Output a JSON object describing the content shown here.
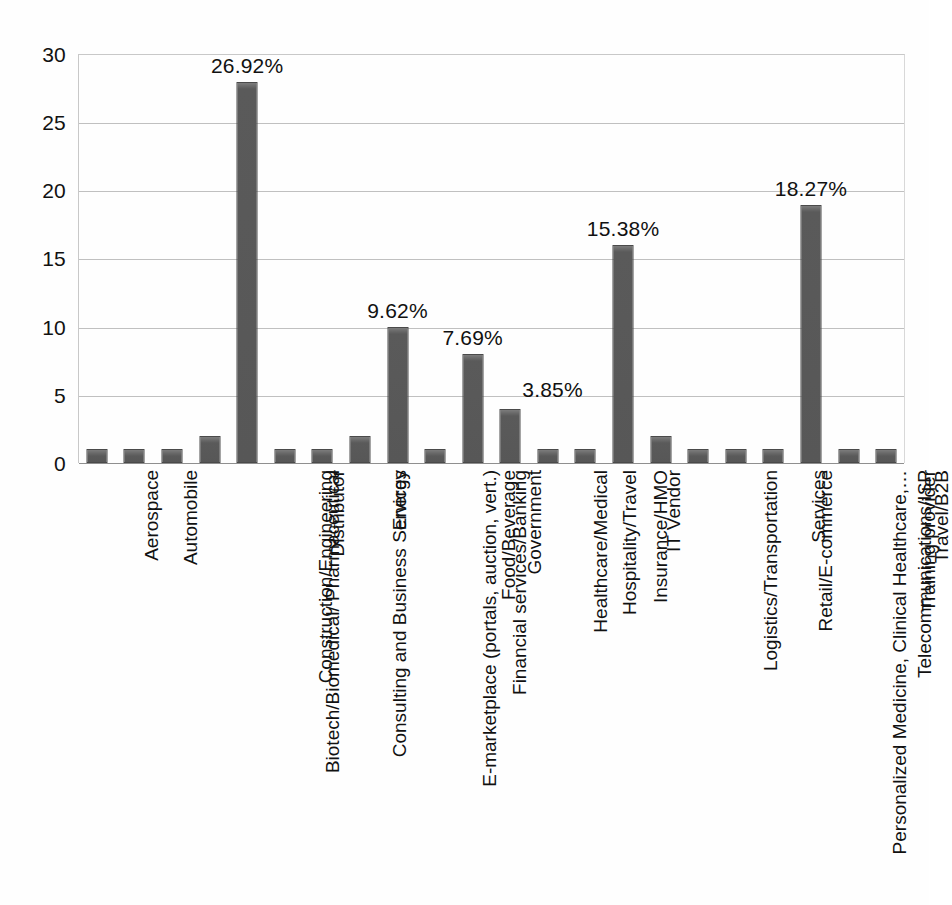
{
  "chart_data": {
    "type": "bar",
    "title": "",
    "subtitle": "",
    "xlabel": "",
    "ylabel": "",
    "ylim": [
      0,
      30
    ],
    "yticks": [
      0,
      5,
      10,
      15,
      20,
      25,
      30
    ],
    "ytick_labels": [
      "0",
      "5",
      "10",
      "15",
      "20",
      "25",
      "30"
    ],
    "grid": "horizontal",
    "legend": "none",
    "bar_color": "#595959",
    "categories": [
      "Aerospace",
      "Automobile",
      "Biotech/Biomedical/ Pharmaceutical",
      "Construction/Engineering",
      "Consulting and Business Services",
      "Distributor",
      "E-marketplace (portals, auction, vert.)",
      "Energy",
      "Financial services/Banking",
      "Food/Beverage",
      "Government",
      "Healthcare/Medical",
      "Hospitality/Travel",
      "Insurance/HMO",
      "IT Vendor",
      "Logistics/Transportation",
      "Personalized Medicine, Clinical Healthcare,…",
      "Retail/E-commerce",
      "Services",
      "Telecommunications/ISP",
      "Training provider",
      "Travel/B2B"
    ],
    "values": [
      1,
      1,
      1,
      2,
      28,
      1,
      1,
      2,
      10,
      1,
      8,
      4,
      1,
      1,
      16,
      2,
      1,
      1,
      1,
      19,
      1,
      1
    ],
    "data_labels": [
      {
        "category": "Consulting and Business Services",
        "index": 4,
        "text": "26.92%"
      },
      {
        "category": "Financial services/Banking",
        "index": 8,
        "text": "9.62%"
      },
      {
        "category": "Government",
        "index": 10,
        "text": "7.69%"
      },
      {
        "category": "Healthcare/Medical",
        "index": 11,
        "text": "3.85%"
      },
      {
        "category": "IT Vendor",
        "index": 14,
        "text": "15.38%"
      },
      {
        "category": "Telecommunications/ISP",
        "index": 19,
        "text": "18.27%"
      }
    ]
  }
}
